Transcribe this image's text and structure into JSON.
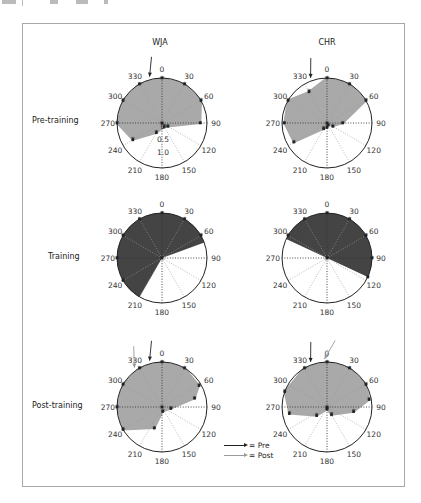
{
  "columns": [
    {
      "label": "WJA",
      "x": 160
    },
    {
      "label": "CHR",
      "x": 327
    }
  ],
  "rows": [
    {
      "label": "Pre-training",
      "y": 121
    },
    {
      "label": "Training",
      "y": 256
    },
    {
      "label": "Post-training",
      "y": 405
    }
  ],
  "legend": {
    "pre_label": "= Pre",
    "post_label": "= Post",
    "pre_color": "#222222",
    "post_color": "#9a9a9a"
  },
  "colors": {
    "pre_post_fill": "#a9a9a9",
    "training_fill": "#444444",
    "circle": "#222222",
    "grid": "#999999",
    "marker": "#222222"
  },
  "chart_data": {
    "type": "polar",
    "title": "",
    "angular_ticks": [
      0,
      30,
      60,
      90,
      120,
      150,
      180,
      210,
      240,
      270,
      300,
      330
    ],
    "angular_direction": "clockwise, 0 at top",
    "radial_ticks": [
      "0",
      "0.5",
      "1.0"
    ],
    "radial_range": [
      0,
      1.0
    ],
    "grid": true,
    "panels": [
      {
        "subject": "WJA",
        "phase": "Pre-training",
        "fill": "light-gray",
        "radial_labels_visible": true,
        "points": [
          {
            "angle": 0,
            "r": 1.0
          },
          {
            "angle": 30,
            "r": 1.0
          },
          {
            "angle": 60,
            "r": 1.0
          },
          {
            "angle": 90,
            "r": 0.85
          },
          {
            "angle": 120,
            "r": 0.15
          },
          {
            "angle": 150,
            "r": 0.1
          },
          {
            "angle": 210,
            "r": 0.25
          },
          {
            "angle": 240,
            "r": 0.75
          },
          {
            "angle": 270,
            "r": 1.0
          },
          {
            "angle": 300,
            "r": 1.0
          },
          {
            "angle": 330,
            "r": 1.0
          }
        ],
        "arrows": [
          {
            "type": "Pre",
            "angle": 345
          }
        ]
      },
      {
        "subject": "CHR",
        "phase": "Pre-training",
        "fill": "light-gray",
        "points": [
          {
            "angle": 0,
            "r": 1.0
          },
          {
            "angle": 30,
            "r": 1.0
          },
          {
            "angle": 60,
            "r": 1.0
          },
          {
            "angle": 90,
            "r": 0.35
          },
          {
            "angle": 120,
            "r": 0.15
          },
          {
            "angle": 150,
            "r": 0.05
          },
          {
            "angle": 180,
            "r": 0.1
          },
          {
            "angle": 210,
            "r": 0.15
          },
          {
            "angle": 240,
            "r": 0.85
          },
          {
            "angle": 270,
            "r": 0.95
          },
          {
            "angle": 300,
            "r": 1.0
          },
          {
            "angle": 330,
            "r": 0.8
          }
        ],
        "arrows": [
          {
            "type": "Pre",
            "angle": 340
          }
        ]
      },
      {
        "subject": "WJA",
        "phase": "Training",
        "fill": "dark-gray",
        "sector_from": 210,
        "sector_to": 70,
        "points": [
          {
            "angle": 0,
            "r": 1.0
          },
          {
            "angle": 30,
            "r": 1.0
          },
          {
            "angle": 60,
            "r": 1.0
          },
          {
            "angle": 240,
            "r": 1.0
          },
          {
            "angle": 270,
            "r": 1.0
          },
          {
            "angle": 300,
            "r": 1.0
          },
          {
            "angle": 330,
            "r": 1.0
          }
        ]
      },
      {
        "subject": "CHR",
        "phase": "Training",
        "fill": "dark-gray",
        "sector_from": 295,
        "sector_to": 115,
        "points": [
          {
            "angle": 0,
            "r": 1.0
          },
          {
            "angle": 30,
            "r": 1.0
          },
          {
            "angle": 60,
            "r": 1.0
          },
          {
            "angle": 90,
            "r": 1.0
          },
          {
            "angle": 115,
            "r": 1.0
          },
          {
            "angle": 300,
            "r": 1.0
          },
          {
            "angle": 330,
            "r": 1.0
          }
        ]
      },
      {
        "subject": "WJA",
        "phase": "Post-training",
        "fill": "light-gray",
        "points": [
          {
            "angle": 0,
            "r": 1.0
          },
          {
            "angle": 30,
            "r": 1.0
          },
          {
            "angle": 60,
            "r": 0.95
          },
          {
            "angle": 75,
            "r": 0.75
          },
          {
            "angle": 100,
            "r": 0.2
          },
          {
            "angle": 170,
            "r": 0.1
          },
          {
            "angle": 200,
            "r": 0.5
          },
          {
            "angle": 240,
            "r": 1.0
          },
          {
            "angle": 270,
            "r": 1.0
          },
          {
            "angle": 300,
            "r": 1.0
          },
          {
            "angle": 330,
            "r": 1.0
          }
        ],
        "arrows": [
          {
            "type": "Pre",
            "angle": 345
          },
          {
            "type": "Post",
            "angle": 325
          }
        ]
      },
      {
        "subject": "CHR",
        "phase": "Post-training",
        "fill": "light-gray",
        "points": [
          {
            "angle": 0,
            "r": 1.0
          },
          {
            "angle": 30,
            "r": 1.0
          },
          {
            "angle": 60,
            "r": 1.0
          },
          {
            "angle": 80,
            "r": 0.95
          },
          {
            "angle": 100,
            "r": 0.6
          },
          {
            "angle": 150,
            "r": 0.2
          },
          {
            "angle": 180,
            "r": 0.05
          },
          {
            "angle": 230,
            "r": 0.3
          },
          {
            "angle": 260,
            "r": 0.85
          },
          {
            "angle": 290,
            "r": 1.0
          },
          {
            "angle": 330,
            "r": 1.0
          }
        ],
        "arrows": [
          {
            "type": "Pre",
            "angle": 340
          },
          {
            "type": "Post",
            "angle": 357
          }
        ]
      }
    ],
    "legend": [
      {
        "label": "= Pre",
        "style": "black arrow"
      },
      {
        "label": "= Post",
        "style": "gray arrow"
      }
    ]
  }
}
